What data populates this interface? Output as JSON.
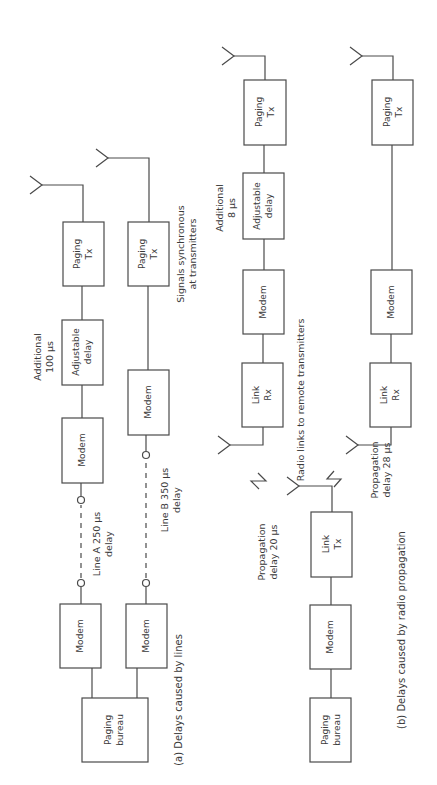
{
  "figure": {
    "orientation": "rotated-90-ccw",
    "colors": {
      "line": "#4a4a4a",
      "text": "#3a3a3a",
      "background": "#ffffff"
    }
  },
  "part_a": {
    "caption": "(a) Delays caused by lines",
    "bureau": {
      "line1": "Paging",
      "line2": "bureau"
    },
    "chain_a": {
      "modem_local": "Modem",
      "line_label": {
        "line1": "Line A 250 µs",
        "line2": "delay"
      },
      "modem_remote": "Modem",
      "adjustable_delay": {
        "line1": "Adjustable",
        "line2": "delay"
      },
      "additional": {
        "line1": "Additional",
        "line2": "100 µs"
      },
      "tx": {
        "line1": "Paging",
        "line2": "Tx"
      }
    },
    "chain_b": {
      "modem_local": "Modem",
      "line_label": {
        "line1": "Line B 350 µs",
        "line2": "delay"
      },
      "modem_remote": "Modem",
      "tx": {
        "line1": "Paging",
        "line2": "Tx"
      }
    },
    "sync_note": {
      "line1": "Signals synchronous",
      "line2": "at transmitters"
    }
  },
  "part_b": {
    "caption": "(b) Delays caused by radio propagation",
    "bureau": {
      "line1": "Paging",
      "line2": "bureau"
    },
    "modem_local": "Modem",
    "link_tx": {
      "line1": "Link",
      "line2": "Tx"
    },
    "radio_note": "Radio links to remote transmitters",
    "prop_1": {
      "line1": "Propagation",
      "line2": "delay 20 µs"
    },
    "prop_2": {
      "line1": "Propagation",
      "line2": "delay 28 µs"
    },
    "remote_1": {
      "link_rx": {
        "line1": "Link",
        "line2": "Rx"
      },
      "modem": "Modem",
      "adjustable_delay": {
        "line1": "Adjustable",
        "line2": "delay"
      },
      "additional": {
        "line1": "Additional",
        "line2": "8 µs"
      },
      "tx": {
        "line1": "Paging",
        "line2": "Tx"
      }
    },
    "remote_2": {
      "link_rx": {
        "line1": "Link",
        "line2": "Rx"
      },
      "modem": "Modem",
      "tx": {
        "line1": "Paging",
        "line2": "Tx"
      }
    }
  }
}
